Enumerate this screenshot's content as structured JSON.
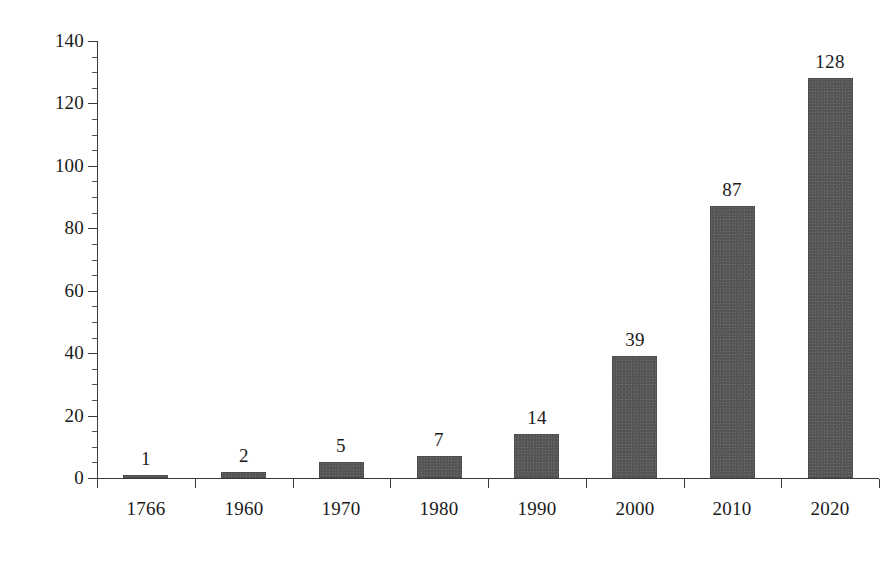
{
  "chart_data": {
    "type": "bar",
    "title": "",
    "subtitle": "",
    "xlabel": "",
    "ylabel": "",
    "categories": [
      "1766",
      "1960",
      "1970",
      "1980",
      "1990",
      "2000",
      "2010",
      "2020"
    ],
    "values": [
      1,
      2,
      5,
      7,
      14,
      39,
      87,
      128
    ],
    "value_labels": [
      "1",
      "2",
      "5",
      "7",
      "14",
      "39",
      "87",
      "128"
    ],
    "ylim": [
      0,
      140
    ],
    "ytick_step": 20,
    "ytick_labels": [
      "0",
      "20",
      "40",
      "60",
      "80",
      "100",
      "120",
      "140"
    ],
    "ytick_values": [
      0,
      20,
      40,
      60,
      80,
      100,
      120,
      140
    ],
    "grid": false,
    "legend": false,
    "legend_position": "none",
    "bar_color": "#555555",
    "axis_color": "#3a3a3a",
    "text_color": "#1a1a1a",
    "background_color": "#ffffff",
    "minor_ticks": true,
    "minor_tick_step": 5,
    "value_labels_shown": true
  }
}
